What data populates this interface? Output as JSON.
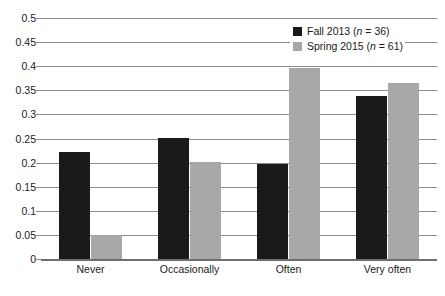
{
  "chart_data": {
    "type": "bar",
    "title": "",
    "subtitle": "",
    "xlabel": "",
    "ylabel": "",
    "categories": [
      "Never",
      "Occasionally",
      "Often",
      "Very often"
    ],
    "series": [
      {
        "name": "Fall 2013 (n = 36)",
        "label_prefix": "Fall 2013 (",
        "label_italic": "n",
        "label_suffix": " = 36)",
        "color": "#1a1a1a",
        "values": [
          0.222,
          0.252,
          0.198,
          0.338
        ]
      },
      {
        "name": "Spring 2015 (n = 61)",
        "label_prefix": "Spring 2015 (",
        "label_italic": "n",
        "label_suffix": " = 61)",
        "color": "#a8a8a8",
        "values": [
          0.05,
          0.201,
          0.396,
          0.365
        ]
      }
    ],
    "ylim": [
      0,
      0.5
    ],
    "ytick_step": 0.05,
    "ytick_labels": [
      "0.5",
      "0.45",
      "0.4",
      "0.35",
      "0.3",
      "0.25",
      "0.2",
      "0.15",
      "0.1",
      "0.05",
      "0"
    ],
    "ytick_values": [
      0.5,
      0.45,
      0.4,
      0.35,
      0.3,
      0.25,
      0.2,
      0.15,
      0.1,
      0.05,
      0
    ],
    "grid": true,
    "grid_orientation": "horizontal",
    "legend_position": "top-right",
    "gridline_color": "#8c8c8c",
    "baseline_color": "#6e6e6e",
    "background_color": "#ffffff"
  }
}
